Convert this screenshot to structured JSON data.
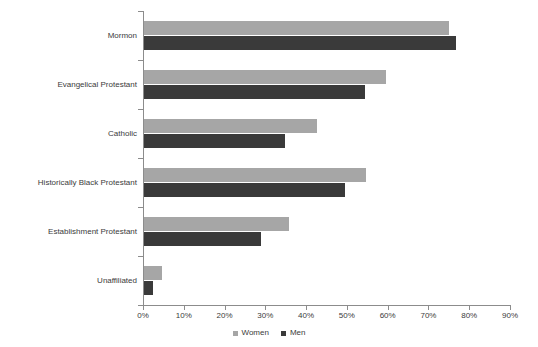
{
  "chart_data": {
    "type": "bar",
    "orientation": "horizontal",
    "title": "",
    "subtitle": "",
    "xlabel": "",
    "ylabel": "",
    "xlim": [
      0,
      90
    ],
    "xtick_values": [
      0,
      10,
      20,
      30,
      40,
      50,
      60,
      70,
      80,
      90
    ],
    "xtick_labels": [
      "0%",
      "10%",
      "20%",
      "30%",
      "40%",
      "50%",
      "60%",
      "70%",
      "80%",
      "90%"
    ],
    "grid": false,
    "legend_position": "bottom-center",
    "categories": [
      "Mormon",
      "Evangelical Protestant",
      "Catholic",
      "Historically Black Protestant",
      "Establishment Protestant",
      "Unaffiliated"
    ],
    "series": [
      {
        "name": "Women",
        "color": "#a6a6a6",
        "values": [
          74.8,
          59.3,
          42.4,
          54.4,
          35.5,
          4.5
        ]
      },
      {
        "name": "Men",
        "color": "#3a3a3a",
        "values": [
          76.5,
          54.2,
          34.6,
          49.3,
          28.7,
          2.3
        ]
      }
    ],
    "axis_color": "#8c8c8c",
    "text_color": "#3b3b3b",
    "background": "#ffffff"
  }
}
